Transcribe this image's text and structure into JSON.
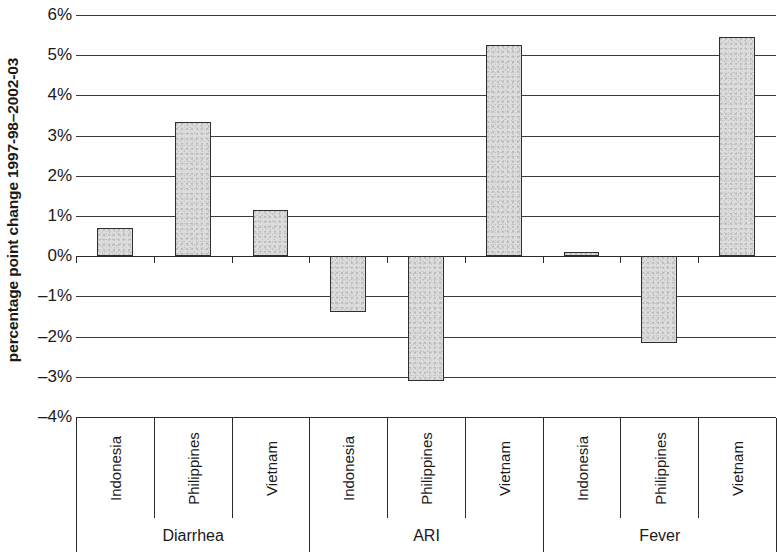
{
  "chart_data": {
    "type": "bar",
    "title": "",
    "xlabel": "",
    "ylabel": "percentage point change 1997-98–2002-03",
    "ylim": [
      -4,
      6
    ],
    "ytick_labels": [
      "6%",
      "5%",
      "4%",
      "3%",
      "2%",
      "1%",
      "0%",
      "–1%",
      "–2%",
      "–3%",
      "–4%"
    ],
    "ytick_values": [
      6,
      5,
      4,
      3,
      2,
      1,
      0,
      -1,
      -2,
      -3,
      -4
    ],
    "grid": true,
    "legend": "none",
    "bar_color": "#dcdcdc",
    "bar_edge_color": "#2f2f2f",
    "axis_color": "#2b2b2b",
    "groups": [
      {
        "label": "Diarrhea",
        "categories": [
          "Indonesia",
          "Philippines",
          "Vietnam"
        ],
        "values": [
          0.7,
          3.35,
          1.15
        ]
      },
      {
        "label": "ARI",
        "categories": [
          "Indonesia",
          "Philippines",
          "Vietnam"
        ],
        "values": [
          -1.4,
          -3.1,
          5.25
        ]
      },
      {
        "label": "Fever",
        "categories": [
          "Indonesia",
          "Philippines",
          "Vietnam"
        ],
        "values": [
          0.1,
          -2.15,
          5.45
        ]
      }
    ]
  }
}
